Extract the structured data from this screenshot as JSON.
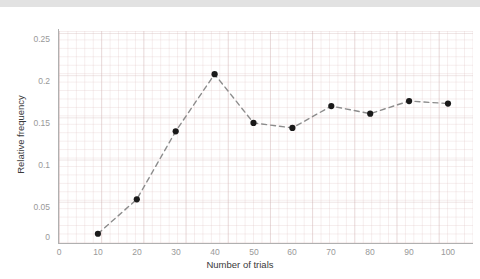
{
  "chart_data": {
    "type": "line",
    "title": "",
    "xlabel": "Number of trials",
    "ylabel": "Relative frequency",
    "x": [
      10,
      20,
      30,
      40,
      50,
      60,
      70,
      80,
      90,
      100
    ],
    "values": [
      0.011,
      0.052,
      0.133,
      0.201,
      0.143,
      0.137,
      0.163,
      0.154,
      0.169,
      0.166
    ],
    "series": [
      {
        "name": "Relative frequency",
        "values": [
          0.011,
          0.052,
          0.133,
          0.201,
          0.143,
          0.137,
          0.163,
          0.154,
          0.169,
          0.166
        ]
      }
    ],
    "xlim": [
      0,
      107
    ],
    "ylim": [
      0,
      0.2655
    ],
    "xticks": [
      0,
      10,
      20,
      30,
      40,
      50,
      60,
      70,
      80,
      90,
      100
    ],
    "xtick_labels": [
      "0",
      "10",
      "20",
      "30",
      "40",
      "50",
      "60",
      "70",
      "80",
      "90",
      "100"
    ],
    "yticks": [
      0,
      0.05,
      0.1,
      0.15,
      0.2,
      0.25
    ],
    "ytick_labels": [
      "0",
      "0.05",
      "0.1",
      "0.15",
      "0.2",
      "0.25"
    ],
    "grid": true,
    "grid_style": "graph-paper",
    "legend": false,
    "line_style": "dashed",
    "line_color": "#8c8c8c",
    "marker": "circle",
    "marker_color": "#1a1a1a",
    "axis_color": "#b0b0b0",
    "tick_label_color": "#999999",
    "axis_title_color": "#3a3a3a",
    "background_color": "#ffffff",
    "top_band_color": "#e2e2e2"
  }
}
